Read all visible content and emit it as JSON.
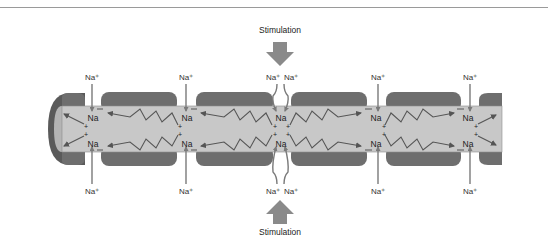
{
  "figure": {
    "stimulation_label": "Stimulation",
    "ion_label_outside": "Na⁺",
    "ion_label_inside": "Na",
    "charge_symbol": "+",
    "colors": {
      "myelin": "#6e6e6e",
      "axon_core": "#c8c8c8",
      "axon_end_dark": "#5a5a5a",
      "axon_end_light": "#b4b4b4",
      "arrow": "#7a7a7a",
      "current_line": "#555555",
      "stim_arrow": "#8a8a8a",
      "text": "#222222"
    },
    "nodes": [
      {
        "id": "node-1",
        "x": 92,
        "labels_top": [
          "Na⁺"
        ],
        "labels_bottom": [
          "Na⁺"
        ]
      },
      {
        "id": "node-2",
        "x": 186,
        "labels_top": [
          "Na⁺"
        ],
        "labels_bottom": [
          "Na⁺"
        ]
      },
      {
        "id": "node-3-stimulated",
        "x": 280,
        "labels_top": [
          "Na⁺",
          "Na⁺"
        ],
        "labels_bottom": [
          "Na⁺",
          "Na⁺"
        ]
      },
      {
        "id": "node-4",
        "x": 378,
        "labels_top": [
          "Na⁺"
        ],
        "labels_bottom": [
          "Na⁺"
        ]
      },
      {
        "id": "node-5",
        "x": 470,
        "labels_top": [
          "Na⁺"
        ],
        "labels_bottom": [
          "Na⁺"
        ]
      }
    ]
  }
}
